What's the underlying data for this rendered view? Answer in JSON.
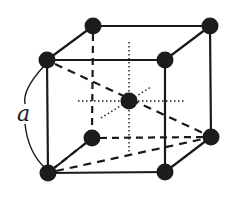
{
  "diagram": {
    "type": "body-centered cubic unit cell",
    "label": "a",
    "colors": {
      "stroke": "#1a1a1a",
      "atom": "#1c1c1c",
      "background": "#ffffff"
    },
    "atoms": {
      "front_top_left": {
        "x": 47,
        "y": 60,
        "r": 8.5
      },
      "front_top_right": {
        "x": 165,
        "y": 60,
        "r": 8.5
      },
      "front_bottom_left": {
        "x": 48,
        "y": 173,
        "r": 8.5
      },
      "front_bottom_right": {
        "x": 165,
        "y": 172,
        "r": 8.5
      },
      "back_top_left": {
        "x": 93,
        "y": 26,
        "r": 8.5
      },
      "back_top_right": {
        "x": 210,
        "y": 26,
        "r": 8.5
      },
      "back_bottom_left": {
        "x": 92,
        "y": 138,
        "r": 8.5
      },
      "back_bottom_right": {
        "x": 211,
        "y": 137,
        "r": 8.5
      },
      "center": {
        "x": 129,
        "y": 101,
        "r": 8.5
      }
    }
  }
}
